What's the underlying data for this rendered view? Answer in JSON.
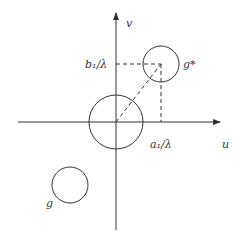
{
  "axes": {
    "horizontal_label": "u",
    "vertical_label": "v"
  },
  "labels": {
    "b_tick": "b₁/λ",
    "a_tick": "a₁/λ",
    "g_star": "g*",
    "g": "g"
  },
  "circles": [
    {
      "name": "origin-circle",
      "cx": 116,
      "cy": 122,
      "r": 27
    },
    {
      "name": "g-star-circle",
      "cx": 161,
      "cy": 64,
      "r": 18
    },
    {
      "name": "g-circle",
      "cx": 70,
      "cy": 185,
      "r": 18
    }
  ],
  "colors": {
    "line": "#333333"
  }
}
